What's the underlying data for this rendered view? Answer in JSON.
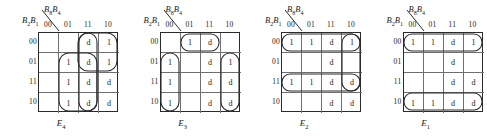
{
  "figure": {
    "background": "#ffffff",
    "line_color": "#2b2b2b",
    "grid_line_color": "#6f6f6f"
  },
  "axis": {
    "col_var_main": "B",
    "col_var_sub1": "8",
    "col_var_sub2": "4",
    "row_var_main": "B",
    "row_var_sub1": "2",
    "row_var_sub2": "1",
    "col_labels": [
      "00",
      "01",
      "11",
      "10"
    ],
    "row_labels": [
      "00",
      "01",
      "11",
      "10"
    ]
  },
  "chart_data": {
    "type": "table",
    "maps": [
      {
        "caption_main": "E",
        "caption_sub": "4",
        "columns": [
          "00",
          "01",
          "11",
          "10"
        ],
        "rows": [
          "00",
          "01",
          "11",
          "10"
        ],
        "cells": [
          [
            "",
            "",
            "d",
            "1"
          ],
          [
            "",
            "1",
            "d",
            "1"
          ],
          [
            "",
            "1",
            "d",
            "d"
          ],
          [
            "",
            "1",
            "d",
            "d"
          ]
        ],
        "groups": [
          {
            "name": "oval-cols-11-10-rows-00-01",
            "x": 40,
            "y": 1,
            "w": 39,
            "h": 38,
            "rx": 10
          },
          {
            "name": "oval-col-11-all-rows",
            "x": 41,
            "y": 1,
            "w": 18,
            "h": 78,
            "rx": 9
          },
          {
            "name": "oval-cols-01-11-rows-01-10",
            "x": 21,
            "y": 21,
            "w": 38,
            "h": 58,
            "rx": 10
          }
        ]
      },
      {
        "caption_main": "E",
        "caption_sub": "3",
        "columns": [
          "00",
          "01",
          "11",
          "10"
        ],
        "rows": [
          "00",
          "01",
          "11",
          "10"
        ],
        "cells": [
          [
            "",
            "1",
            "d",
            ""
          ],
          [
            "1",
            "",
            "d",
            "1"
          ],
          [
            "1",
            "",
            "d",
            "d"
          ],
          [
            "1",
            "",
            "d",
            "d"
          ]
        ],
        "groups": [
          {
            "name": "oval-row-00-cols-01-11",
            "x": 21,
            "y": 2,
            "w": 38,
            "h": 17,
            "rx": 8
          },
          {
            "name": "oval-col-00-rows-01-10",
            "x": 1,
            "y": 21,
            "w": 18,
            "h": 58,
            "rx": 9
          },
          {
            "name": "oval-col-10-rows-01-10",
            "x": 61,
            "y": 21,
            "w": 18,
            "h": 58,
            "rx": 9
          }
        ]
      },
      {
        "caption_main": "E",
        "caption_sub": "2",
        "columns": [
          "00",
          "01",
          "11",
          "10"
        ],
        "rows": [
          "00",
          "01",
          "11",
          "10"
        ],
        "cells": [
          [
            "1",
            "1",
            "d",
            "1"
          ],
          [
            "",
            "",
            "d",
            ""
          ],
          [
            "1",
            "1",
            "d",
            "d"
          ],
          [
            "",
            "",
            "d",
            "d"
          ]
        ],
        "groups": [
          {
            "name": "oval-row-00-all-cols",
            "x": 1,
            "y": 2,
            "w": 78,
            "h": 17,
            "rx": 8
          },
          {
            "name": "oval-row-11-all-cols",
            "x": 1,
            "y": 42,
            "w": 78,
            "h": 17,
            "rx": 8
          },
          {
            "name": "oval-col-10-rows-00-11",
            "x": 61,
            "y": 2,
            "w": 18,
            "h": 57,
            "rx": 9
          }
        ]
      },
      {
        "caption_main": "E",
        "caption_sub": "1",
        "columns": [
          "00",
          "01",
          "11",
          "10"
        ],
        "rows": [
          "00",
          "01",
          "11",
          "10"
        ],
        "cells": [
          [
            "1",
            "1",
            "d",
            "1"
          ],
          [
            "",
            "",
            "d",
            ""
          ],
          [
            "",
            "",
            "d",
            "d"
          ],
          [
            "1",
            "1",
            "d",
            "d"
          ]
        ],
        "groups": [
          {
            "name": "oval-row-00-all-cols",
            "x": 1,
            "y": 2,
            "w": 78,
            "h": 17,
            "rx": 8
          },
          {
            "name": "oval-row-10-all-cols",
            "x": 1,
            "y": 61,
            "w": 78,
            "h": 17,
            "rx": 8
          }
        ]
      }
    ]
  }
}
